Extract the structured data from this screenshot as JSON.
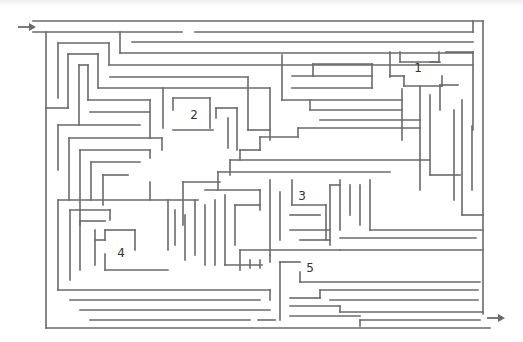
{
  "maze": {
    "stroke_color": "#6a6a6a",
    "labels": [
      {
        "text": "1",
        "x": 418,
        "y": 68
      },
      {
        "text": "2",
        "x": 194,
        "y": 115
      },
      {
        "text": "3",
        "x": 302,
        "y": 196
      },
      {
        "text": "4",
        "x": 121,
        "y": 253
      },
      {
        "text": "5",
        "x": 310,
        "y": 268
      }
    ],
    "entrance_arrow": {
      "x1": 18,
      "y1": 27,
      "x2": 36,
      "y2": 27
    },
    "exit_arrow": {
      "x1": 487,
      "y1": 318,
      "x2": 505,
      "y2": 318
    },
    "walls": [
      [
        33,
        21,
        483,
        21
      ],
      [
        483,
        21,
        483,
        314
      ],
      [
        33,
        32,
        182,
        32
      ],
      [
        195,
        32,
        473,
        32
      ],
      [
        473,
        32,
        473,
        21
      ],
      [
        46,
        32,
        46,
        328
      ],
      [
        46,
        328,
        490,
        328
      ],
      [
        120,
        32,
        120,
        53
      ],
      [
        120,
        53,
        473,
        53
      ],
      [
        132,
        42,
        473,
        42
      ],
      [
        58,
        43,
        109,
        43
      ],
      [
        58,
        43,
        58,
        98
      ],
      [
        109,
        43,
        109,
        65
      ],
      [
        109,
        65,
        473,
        65
      ],
      [
        68,
        54,
        98,
        54
      ],
      [
        68,
        54,
        68,
        108
      ],
      [
        46,
        108,
        68,
        108
      ],
      [
        98,
        54,
        98,
        88
      ],
      [
        79,
        65,
        88,
        65
      ],
      [
        79,
        65,
        79,
        125
      ],
      [
        88,
        65,
        88,
        100
      ],
      [
        88,
        100,
        150,
        100
      ],
      [
        110,
        77,
        248,
        77
      ],
      [
        98,
        88,
        270,
        88
      ],
      [
        163,
        88,
        163,
        128
      ],
      [
        90,
        112,
        150,
        112
      ],
      [
        150,
        100,
        150,
        138
      ],
      [
        58,
        125,
        140,
        125
      ],
      [
        58,
        125,
        58,
        170
      ],
      [
        69,
        138,
        162,
        138
      ],
      [
        69,
        138,
        69,
        200
      ],
      [
        162,
        138,
        162,
        150
      ],
      [
        80,
        150,
        150,
        150
      ],
      [
        80,
        150,
        80,
        225
      ],
      [
        150,
        150,
        150,
        158
      ],
      [
        91,
        162,
        140,
        162
      ],
      [
        91,
        162,
        91,
        200
      ],
      [
        103,
        175,
        128,
        175
      ],
      [
        103,
        175,
        103,
        205
      ],
      [
        173,
        98,
        210,
        98
      ],
      [
        173,
        98,
        173,
        110
      ],
      [
        210,
        98,
        210,
        128
      ],
      [
        173,
        130,
        213,
        130
      ],
      [
        216,
        108,
        237,
        108
      ],
      [
        216,
        108,
        216,
        118
      ],
      [
        228,
        118,
        228,
        148
      ],
      [
        237,
        108,
        237,
        150
      ],
      [
        248,
        77,
        248,
        130
      ],
      [
        248,
        130,
        270,
        130
      ],
      [
        270,
        88,
        270,
        140
      ],
      [
        282,
        55,
        282,
        100
      ],
      [
        282,
        100,
        402,
        100
      ],
      [
        292,
        76,
        372,
        76
      ],
      [
        292,
        88,
        372,
        88
      ],
      [
        313,
        64,
        372,
        64
      ],
      [
        313,
        64,
        313,
        76
      ],
      [
        372,
        64,
        372,
        88
      ],
      [
        390,
        52,
        390,
        77
      ],
      [
        400,
        52,
        400,
        62
      ],
      [
        400,
        62,
        439,
        62
      ],
      [
        439,
        52,
        439,
        62
      ],
      [
        390,
        76,
        404,
        76
      ],
      [
        404,
        76,
        404,
        86
      ],
      [
        404,
        86,
        442,
        86
      ],
      [
        442,
        86,
        442,
        76
      ],
      [
        430,
        62,
        440,
        62
      ],
      [
        446,
        52,
        473,
        52
      ],
      [
        473,
        52,
        473,
        130
      ],
      [
        440,
        85,
        458,
        85
      ],
      [
        440,
        85,
        440,
        110
      ],
      [
        402,
        89,
        402,
        140
      ],
      [
        420,
        86,
        420,
        190
      ],
      [
        430,
        95,
        430,
        175
      ],
      [
        430,
        175,
        460,
        175
      ],
      [
        454,
        110,
        454,
        200
      ],
      [
        462,
        100,
        462,
        215
      ],
      [
        462,
        215,
        483,
        215
      ],
      [
        472,
        126,
        472,
        190
      ],
      [
        310,
        100,
        310,
        110
      ],
      [
        310,
        110,
        402,
        110
      ],
      [
        320,
        120,
        420,
        120
      ],
      [
        298,
        128,
        420,
        128
      ],
      [
        298,
        128,
        298,
        137
      ],
      [
        260,
        137,
        298,
        137
      ],
      [
        260,
        137,
        260,
        150
      ],
      [
        240,
        150,
        260,
        150
      ],
      [
        240,
        150,
        240,
        160
      ],
      [
        230,
        160,
        430,
        160
      ],
      [
        230,
        160,
        230,
        175
      ],
      [
        218,
        172,
        390,
        172
      ],
      [
        218,
        172,
        218,
        190
      ],
      [
        205,
        190,
        260,
        190
      ],
      [
        58,
        200,
        198,
        200
      ],
      [
        58,
        200,
        58,
        290
      ],
      [
        150,
        182,
        150,
        200
      ],
      [
        183,
        182,
        220,
        182
      ],
      [
        183,
        182,
        183,
        225
      ],
      [
        70,
        210,
        110,
        210
      ],
      [
        70,
        210,
        70,
        280
      ],
      [
        110,
        210,
        110,
        220
      ],
      [
        80,
        221,
        105,
        221
      ],
      [
        80,
        221,
        80,
        270
      ],
      [
        95,
        230,
        95,
        265
      ],
      [
        105,
        230,
        135,
        230
      ],
      [
        105,
        230,
        105,
        240
      ],
      [
        135,
        230,
        135,
        250
      ],
      [
        95,
        240,
        105,
        240
      ],
      [
        105,
        254,
        105,
        270
      ],
      [
        105,
        270,
        168,
        270
      ],
      [
        168,
        200,
        168,
        250
      ],
      [
        175,
        210,
        175,
        245
      ],
      [
        185,
        215,
        185,
        260
      ],
      [
        195,
        200,
        195,
        255
      ],
      [
        205,
        205,
        205,
        265
      ],
      [
        215,
        200,
        215,
        265
      ],
      [
        225,
        195,
        225,
        265
      ],
      [
        225,
        265,
        262,
        265
      ],
      [
        235,
        205,
        260,
        205
      ],
      [
        235,
        205,
        235,
        245
      ],
      [
        260,
        190,
        260,
        210
      ],
      [
        270,
        180,
        270,
        255
      ],
      [
        280,
        192,
        280,
        240
      ],
      [
        292,
        180,
        292,
        205
      ],
      [
        292,
        205,
        326,
        205
      ],
      [
        326,
        205,
        326,
        240
      ],
      [
        290,
        215,
        320,
        215
      ],
      [
        290,
        230,
        330,
        230
      ],
      [
        300,
        240,
        330,
        240
      ],
      [
        330,
        185,
        330,
        245
      ],
      [
        330,
        185,
        340,
        185
      ],
      [
        340,
        180,
        340,
        230
      ],
      [
        350,
        185,
        350,
        215
      ],
      [
        360,
        185,
        360,
        225
      ],
      [
        370,
        180,
        370,
        230
      ],
      [
        370,
        230,
        483,
        230
      ],
      [
        340,
        250,
        483,
        250
      ],
      [
        340,
        238,
        476,
        238
      ],
      [
        240,
        250,
        340,
        250
      ],
      [
        240,
        250,
        240,
        270
      ],
      [
        250,
        260,
        250,
        268
      ],
      [
        260,
        260,
        260,
        268
      ],
      [
        270,
        255,
        270,
        262
      ],
      [
        280,
        262,
        300,
        262
      ],
      [
        280,
        262,
        280,
        320
      ],
      [
        300,
        272,
        300,
        282
      ],
      [
        300,
        282,
        480,
        282
      ],
      [
        320,
        290,
        478,
        290
      ],
      [
        320,
        290,
        320,
        298
      ],
      [
        290,
        298,
        320,
        298
      ],
      [
        330,
        300,
        478,
        300
      ],
      [
        290,
        306,
        340,
        306
      ],
      [
        340,
        306,
        340,
        312
      ],
      [
        340,
        312,
        483,
        312
      ],
      [
        290,
        316,
        360,
        316
      ],
      [
        360,
        320,
        480,
        320
      ],
      [
        360,
        320,
        360,
        326
      ],
      [
        58,
        290,
        270,
        290
      ],
      [
        270,
        290,
        270,
        300
      ],
      [
        70,
        300,
        260,
        300
      ],
      [
        80,
        310,
        270,
        310
      ],
      [
        90,
        320,
        250,
        320
      ],
      [
        258,
        320,
        275,
        320
      ]
    ]
  }
}
